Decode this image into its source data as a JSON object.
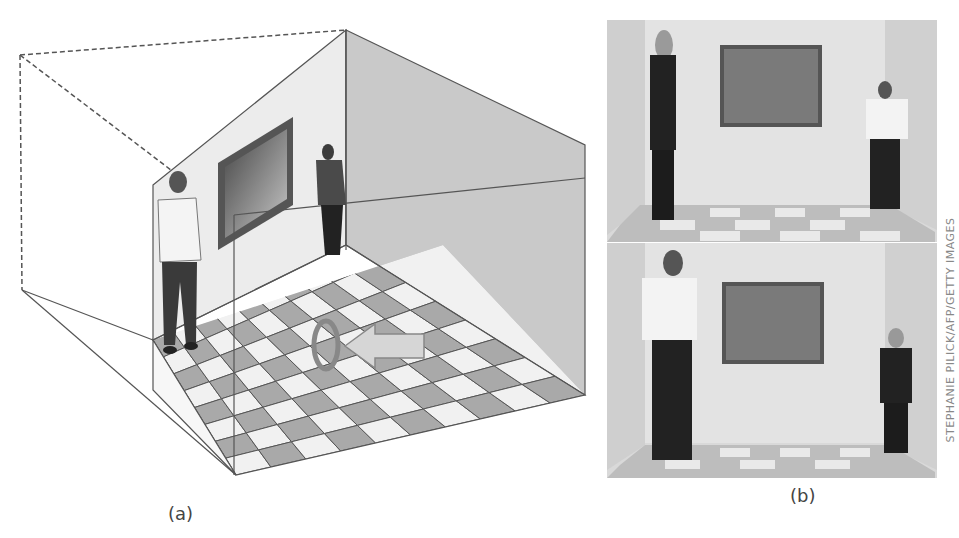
{
  "figure": {
    "panels": [
      {
        "id": "a",
        "caption": "(a)",
        "description": "Ames room schematic: trapezoidal room with checkerboard floor, viewer peephole, man at left corner appears large, woman at far right corner"
      },
      {
        "id": "b",
        "caption": "(b)",
        "description": "Photographs of a real Ames room; two people swap corners and appear to change size"
      }
    ],
    "credit": "STEPHANIE PILICK/AFP/GETTY IMAGES",
    "colors": {
      "wall_left": "#ececec",
      "wall_right": "#c9c9c9",
      "tile_dark": "#a9a9a9",
      "tile_light": "#f1f1f1",
      "frame": "#444444",
      "line": "#555555",
      "arrow_fill": "#d6d6d6"
    }
  }
}
